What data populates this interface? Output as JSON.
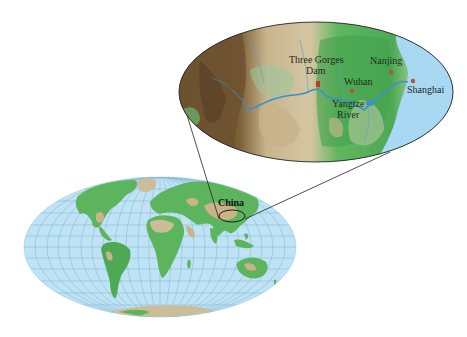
{
  "figure": {
    "type": "map",
    "world_map": {
      "projection": "ellipse (Mollweide-like)",
      "highlight_label": "China"
    },
    "inset_map": {
      "region": "Yangtze River basin",
      "labels": {
        "three_gorges_line1": "Three Gorges",
        "three_gorges_line2": "Dam",
        "wuhan": "Wuhan",
        "nanjing": "Nanjing",
        "shanghai": "Shanghai",
        "yangtze_line1": "Yangtze",
        "yangtze_line2": "River"
      }
    },
    "colors": {
      "ocean": "#bfe3f5",
      "ocean_inset": "#a8d8f2",
      "land_green": "#5cb45c",
      "land_dark_green": "#3a8f3e",
      "land_tan": "#c9b48a",
      "land_brown": "#7a5e34",
      "river": "#3a8fd0",
      "city_marker": "#c0392b",
      "grid": "#6fa8c9",
      "outline": "#222222"
    }
  }
}
